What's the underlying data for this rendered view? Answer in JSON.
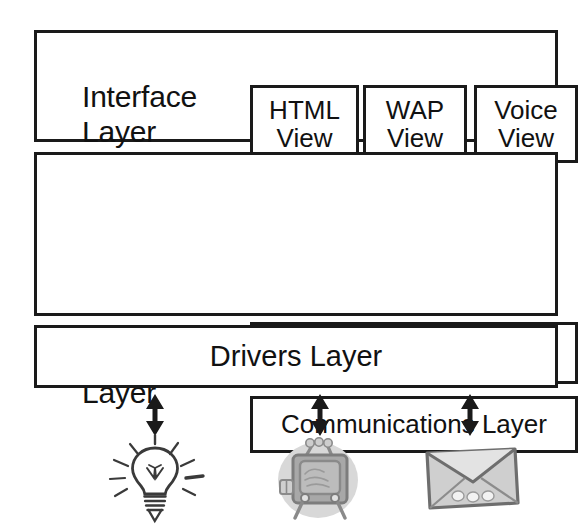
{
  "diagram": {
    "background_color": "#ffffff",
    "stroke_color": "#1a1a1a",
    "layers": [
      {
        "id": "interface",
        "caption": "Interface\nLayer",
        "children": [
          {
            "id": "html-view",
            "label": "HTML\nView"
          },
          {
            "id": "wap-view",
            "label": "WAP\nView"
          },
          {
            "id": "voice-view",
            "label": "Voice\nView"
          }
        ]
      },
      {
        "id": "logical",
        "caption": "Logical\nLayer",
        "children": [
          {
            "id": "services-layer",
            "label": "Services Layer"
          },
          {
            "id": "comms-layer",
            "label": "Communications Layer"
          }
        ]
      },
      {
        "id": "drivers",
        "caption": "Drivers Layer",
        "children": []
      }
    ],
    "connectors": [
      {
        "id": "connector-bulb",
        "icon": "double-headed-vertical-arrow-icon"
      },
      {
        "id": "connector-tv",
        "icon": "double-headed-vertical-arrow-icon"
      },
      {
        "id": "connector-mail",
        "icon": "double-headed-vertical-arrow-icon"
      }
    ],
    "devices": [
      {
        "id": "device-lightbulb",
        "icon": "lightbulb-icon",
        "color": "#3a3a3a"
      },
      {
        "id": "device-tv",
        "icon": "television-icon",
        "color": "#8f8f8f"
      },
      {
        "id": "device-envelope",
        "icon": "envelope-icon",
        "color": "#8f8f8f"
      }
    ]
  }
}
